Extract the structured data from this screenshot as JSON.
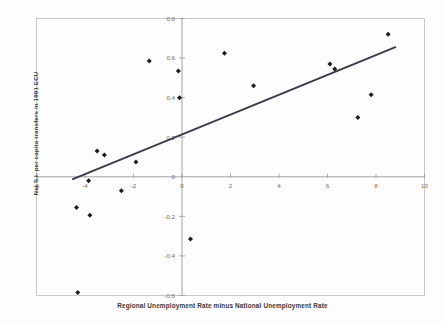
{
  "chart_data": {
    "type": "scatter",
    "title": "",
    "xlabel": "Regional Unemployment Rate minus National Unemployment Rate",
    "ylabel": "Net S.I. per capita transfers in 1991 ECU",
    "xlim": [
      -6,
      10
    ],
    "ylim": [
      -0.6,
      0.8
    ],
    "xticks": [
      -6,
      -4,
      -2,
      0,
      2,
      4,
      6,
      8,
      10
    ],
    "xticklabels": [
      "-6",
      "-4",
      "-2",
      "0",
      "2",
      "4",
      "6",
      "8",
      "10"
    ],
    "yticks": [
      -0.6,
      -0.4,
      -0.2,
      0,
      0.2,
      0.4,
      0.6,
      0.8
    ],
    "yticklabels": [
      "-0.6",
      "-0.4",
      "-0.2",
      "0",
      "0.2",
      "0.4",
      "0.6",
      "0.8"
    ],
    "grid": false,
    "legend": false,
    "legend_position": "none",
    "marker": "diamond",
    "marker_color": "#1c1c24",
    "series": [
      {
        "name": "Regions",
        "points": [
          {
            "x": -4.35,
            "y": -0.155
          },
          {
            "x": -4.3,
            "y": -0.585
          },
          {
            "x": -3.85,
            "y": -0.02
          },
          {
            "x": -3.8,
            "y": -0.195
          },
          {
            "x": -3.5,
            "y": 0.13
          },
          {
            "x": -3.2,
            "y": 0.11
          },
          {
            "x": -2.5,
            "y": -0.07
          },
          {
            "x": -1.9,
            "y": 0.075
          },
          {
            "x": -1.35,
            "y": 0.585
          },
          {
            "x": -0.15,
            "y": 0.535
          },
          {
            "x": -0.1,
            "y": 0.4
          },
          {
            "x": 0.35,
            "y": -0.315
          },
          {
            "x": 1.75,
            "y": 0.625
          },
          {
            "x": 2.95,
            "y": 0.46
          },
          {
            "x": 6.1,
            "y": 0.57
          },
          {
            "x": 6.3,
            "y": 0.545
          },
          {
            "x": 7.25,
            "y": 0.3
          },
          {
            "x": 7.8,
            "y": 0.415
          },
          {
            "x": 8.5,
            "y": 0.72
          }
        ]
      }
    ],
    "trendline": {
      "name": "regression-line",
      "color": "#3b3b4a",
      "x0": -4.5,
      "y0": -0.012,
      "x1": 8.8,
      "y1": 0.655
    }
  }
}
